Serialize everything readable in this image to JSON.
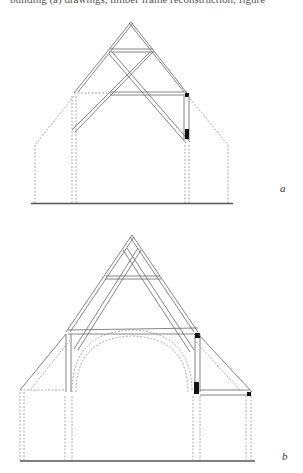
{
  "top_text": "building (a) drawings, timber frame reconstruction; figure",
  "figures": [
    {
      "id": "a",
      "label": "a",
      "description": "Cross-section of aisled timber-framed building with crown-braced roof truss"
    },
    {
      "id": "b",
      "label": "b",
      "description": "Cross-section of aisled hall with arch-braced open truss"
    }
  ],
  "colors": {
    "line": "#666666",
    "dashed": "#888888",
    "solid_post": "#111111"
  }
}
